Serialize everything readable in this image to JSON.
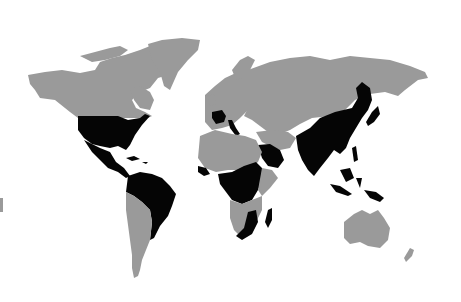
{
  "map": {
    "type": "world choropleth",
    "colors": {
      "background": "#ffffff",
      "land": "#9a9a9a",
      "highlighted": "#050505"
    },
    "highlighted_regions": [
      "United States",
      "Mexico",
      "Central America",
      "Colombia",
      "Venezuela",
      "Brazil",
      "France",
      "Italy",
      "Saudi Arabia",
      "Yemen",
      "West Africa coast",
      "Central Africa",
      "East Africa",
      "Southern Africa east",
      "Madagascar",
      "India",
      "China",
      "Southeast Asia",
      "Korea",
      "Japan",
      "Philippines",
      "Indonesia",
      "Papua New Guinea"
    ],
    "gray_regions": [
      "Canada",
      "Alaska",
      "Greenland",
      "Europe",
      "Russia",
      "Central Asia",
      "Middle East",
      "North Africa",
      "Southern Africa west",
      "South America south",
      "Australia",
      "New Zealand"
    ]
  }
}
